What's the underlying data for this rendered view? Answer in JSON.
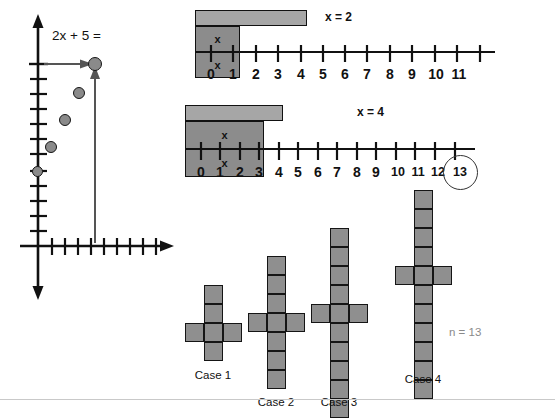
{
  "figure": {
    "title_text": "2x + 5 =",
    "n_annotation": "n = 13",
    "bottom_rule": true
  },
  "graph": {
    "equation_label": "2x + 5 =",
    "x_axis_name": "x-axis",
    "y_axis_name": "y-axis",
    "points": [
      {
        "x": 0,
        "y": 5
      },
      {
        "x": 1,
        "y": 7
      },
      {
        "x": 2,
        "y": 9
      },
      {
        "x": 3,
        "y": 11
      },
      {
        "x": 4,
        "y": 13
      }
    ],
    "highlighted_point": {
      "x": 4,
      "y": 13
    },
    "origin_point": {
      "x": 0,
      "y": 5
    },
    "y_tick_count": 12,
    "x_tick_count": 9
  },
  "numberlines": [
    {
      "id": "line-1",
      "label": "x = 2",
      "min": 0,
      "max": 11,
      "tick_labels": [
        "0",
        "1",
        "2",
        "3",
        "4",
        "5",
        "6",
        "7",
        "8",
        "9",
        "10",
        "11"
      ],
      "constant_bar": {
        "from": 0,
        "to": 5,
        "label": ""
      },
      "variable_bars": [
        {
          "from": 5,
          "to": 7,
          "label": "x"
        },
        {
          "from": 7,
          "to": 9,
          "label": "x"
        }
      ],
      "circled_label": null
    },
    {
      "id": "line-2",
      "label": "x = 4",
      "min": 0,
      "max": 13,
      "tick_labels": [
        "0",
        "1",
        "2",
        "3",
        "4",
        "5",
        "6",
        "7",
        "8",
        "9",
        "10",
        "11",
        "12",
        "13"
      ],
      "constant_bar": {
        "from": 0,
        "to": 5,
        "label": ""
      },
      "variable_bars": [
        {
          "from": 5,
          "to": 9,
          "label": "x"
        },
        {
          "from": 9,
          "to": 13,
          "label": "x"
        }
      ],
      "circled_label": "13"
    }
  ],
  "cases": [
    {
      "label": "Case 1",
      "vertical_squares": 4,
      "arm_squares": 2,
      "total_squares": 6,
      "arm_row_from_top": 3
    },
    {
      "label": "Case 2",
      "vertical_squares": 7,
      "arm_squares": 2,
      "total_squares": 9,
      "arm_row_from_top": 4
    },
    {
      "label": "Case 3",
      "vertical_squares": 10,
      "arm_squares": 2,
      "total_squares": 12,
      "arm_row_from_top": 5
    },
    {
      "label": "Case 4",
      "vertical_squares": 13,
      "arm_squares": 2,
      "total_squares": 15,
      "arm_row_from_top": 6
    }
  ],
  "colors": {
    "bar_light": "#a6a6a6",
    "bar_dark": "#8c8c8c",
    "cell_fill": "#8f8f8f",
    "stroke": "#111111",
    "muted_text": "#8a8a8a",
    "background": "#ffffff"
  }
}
